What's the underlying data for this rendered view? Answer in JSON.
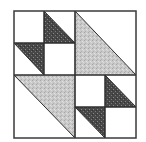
{
  "diagram": {
    "type": "quilt-block",
    "grid": "4x4",
    "colors": {
      "background": "#ffffff",
      "light_fabric": "#c8c8c8",
      "dark_fabric": "#4a4a4a",
      "outline": "#2f2f2f"
    },
    "bounds": {
      "x0": 14,
      "y0": 11,
      "x1": 136,
      "y1": 138
    },
    "pieces": [
      {
        "name": "small-dark-triangle-top-left-upper",
        "fill": "dark",
        "points": "44,11 44,43 75,43"
      },
      {
        "name": "small-dark-triangle-top-left-lower",
        "fill": "dark",
        "points": "14,43 44,43 44,75"
      },
      {
        "name": "large-light-triangle-top-right",
        "fill": "light",
        "points": "75,11 75,75 136,75"
      },
      {
        "name": "large-light-triangle-bottom-left",
        "fill": "light",
        "points": "14,75 75,75 75,138"
      },
      {
        "name": "small-dark-triangle-bottom-right-upper",
        "fill": "dark",
        "points": "105,75 105,107 136,107"
      },
      {
        "name": "small-dark-triangle-bottom-right-lower",
        "fill": "dark",
        "points": "75,107 105,107 105,138"
      }
    ]
  }
}
